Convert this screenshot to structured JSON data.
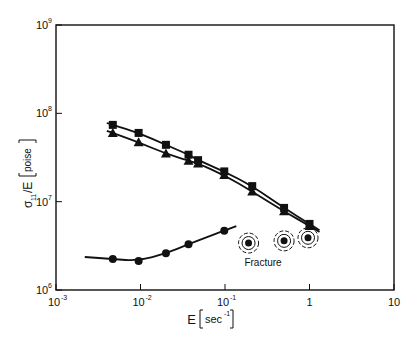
{
  "chart_data": {
    "type": "scatter",
    "title": "",
    "xlabel": "E [sec⁻¹]",
    "ylabel": "σ₁₁/E [poise]",
    "xscale": "log",
    "yscale": "log",
    "xlim": [
      0.001,
      10
    ],
    "ylim": [
      1000000,
      1000000000
    ],
    "x_ticks": [
      "10⁻³",
      "10⁻²",
      "10⁻¹",
      "1",
      "10"
    ],
    "y_ticks": [
      "10⁶",
      "10⁷",
      "10⁸",
      "10⁹"
    ],
    "grid": false,
    "legend": null,
    "series": [
      {
        "name": "squares",
        "marker": "square",
        "x": [
          0.0047,
          0.0095,
          0.02,
          0.037,
          0.048,
          0.098,
          0.21,
          0.5,
          1.0
        ],
        "y": [
          74000000,
          60000000,
          44000000,
          34000000,
          29500000,
          22000000,
          15000000,
          8500000,
          5600000
        ],
        "fit_line": true
      },
      {
        "name": "triangles",
        "marker": "triangle",
        "x": [
          0.0047,
          0.0095,
          0.02,
          0.037,
          0.048,
          0.098,
          0.21,
          0.5,
          1.0
        ],
        "y": [
          60000000,
          47000000,
          35000000,
          29000000,
          27000000,
          20000000,
          13000000,
          7800000,
          5300000
        ],
        "fit_line": true
      },
      {
        "name": "circles",
        "marker": "circle",
        "x": [
          0.0047,
          0.0095,
          0.02,
          0.037,
          0.098
        ],
        "y": [
          2240000,
          2130000,
          2600000,
          3300000,
          4700000
        ],
        "fit_line": true
      },
      {
        "name": "fracture",
        "marker": "circle-dashed-ring",
        "x": [
          0.19,
          0.5,
          0.96
        ],
        "y": [
          3400000,
          3600000,
          3900000
        ],
        "fit_line": false
      }
    ],
    "annotations": [
      {
        "text": "Fracture",
        "x": 0.5,
        "y": 2500000
      }
    ]
  },
  "labels": {
    "xlabel_main": "E",
    "xlabel_unit": "sec",
    "xlabel_exp": "-1",
    "ylabel_main": "σ",
    "ylabel_sub": "11",
    "ylabel_rest": "/E",
    "ylabel_unit": "poise",
    "annotation": "Fracture",
    "x_tick_base": [
      "10",
      "10",
      "10",
      "1",
      "10"
    ],
    "x_tick_exp": [
      "-3",
      "-2",
      "-1",
      "",
      ""
    ],
    "y_tick_base": [
      "10",
      "10",
      "10",
      "10"
    ],
    "y_tick_exp": [
      "6",
      "7",
      "8",
      "9"
    ]
  }
}
